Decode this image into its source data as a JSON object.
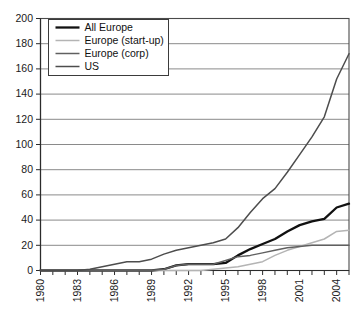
{
  "chart_data": {
    "type": "line",
    "title": "",
    "xlabel": "",
    "ylabel": "",
    "xlim": [
      1980,
      2005
    ],
    "ylim": [
      0,
      200
    ],
    "grid": true,
    "legend_position": "top-left",
    "y_ticks": [
      0,
      20,
      40,
      60,
      80,
      100,
      120,
      140,
      160,
      180,
      200
    ],
    "y_tick_labels": [
      "0",
      "20",
      "40",
      "60",
      "80",
      "100",
      "120",
      "140",
      "160",
      "180",
      "200"
    ],
    "x_ticks": [
      1980,
      1981,
      1982,
      1983,
      1984,
      1985,
      1986,
      1987,
      1988,
      1989,
      1990,
      1991,
      1992,
      1993,
      1994,
      1995,
      1996,
      1997,
      1998,
      1999,
      2000,
      2001,
      2002,
      2003,
      2004,
      2005
    ],
    "x_tick_labels": [
      "1980",
      "",
      "",
      "1983",
      "",
      "",
      "1986",
      "",
      "",
      "1989",
      "",
      "",
      "1992",
      "",
      "",
      "1995",
      "",
      "",
      "1998",
      "",
      "",
      "2001",
      "",
      "",
      "2004",
      ""
    ],
    "x": [
      1980,
      1981,
      1982,
      1983,
      1984,
      1985,
      1986,
      1987,
      1988,
      1989,
      1990,
      1991,
      1992,
      1993,
      1994,
      1995,
      1996,
      1997,
      1998,
      1999,
      2000,
      2001,
      2002,
      2003,
      2004,
      2005
    ],
    "series": [
      {
        "name": "All Europe",
        "color": "#111111",
        "width": 2.3,
        "values": [
          0,
          0,
          0,
          0,
          0,
          0,
          0,
          0,
          0,
          0,
          1,
          4,
          5,
          5,
          5,
          6,
          12,
          17,
          21,
          25,
          31,
          36,
          39,
          41,
          50,
          53
        ]
      },
      {
        "name": "Europe (start-up)",
        "color": "#b4b4b4",
        "width": 1.5,
        "values": [
          0,
          0,
          0,
          0,
          0,
          0,
          0,
          0,
          0,
          0,
          0,
          0,
          0,
          0,
          1,
          2,
          3,
          5,
          7,
          12,
          16,
          19,
          22,
          25,
          31,
          32
        ]
      },
      {
        "name": "Europe (corp)",
        "color": "#606060",
        "width": 1.5,
        "values": [
          0,
          0,
          0,
          0,
          0,
          0,
          0,
          0,
          0,
          0,
          1,
          4,
          5,
          5,
          5,
          8,
          11,
          12,
          14,
          16,
          18,
          19,
          20,
          20,
          20,
          20
        ]
      },
      {
        "name": "US",
        "color": "#4d4d4d",
        "width": 1.5,
        "values": [
          0,
          0,
          0,
          0,
          1,
          3,
          5,
          7,
          7,
          9,
          13,
          16,
          18,
          20,
          22,
          25,
          34,
          46,
          57,
          65,
          78,
          92,
          106,
          122,
          152,
          172
        ]
      }
    ]
  },
  "legend": {
    "entries": [
      {
        "label": "All Europe"
      },
      {
        "label": "Europe (start-up)"
      },
      {
        "label": "Europe (corp)"
      },
      {
        "label": "US"
      }
    ]
  }
}
